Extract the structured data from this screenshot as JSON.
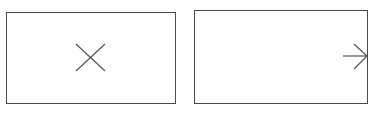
{
  "diagram": {
    "stroke_color": "#4a4a4a",
    "icon_color": "#555555",
    "background": "#ffffff",
    "panels": [
      {
        "id": "left",
        "icon": "close-x-icon",
        "box": {
          "x": 6,
          "y": 12,
          "width": 169,
          "height": 91
        }
      },
      {
        "id": "right",
        "icon": "arrow-right-icon",
        "box": {
          "x": 194,
          "y": 10,
          "width": 173,
          "height": 93
        }
      }
    ]
  }
}
